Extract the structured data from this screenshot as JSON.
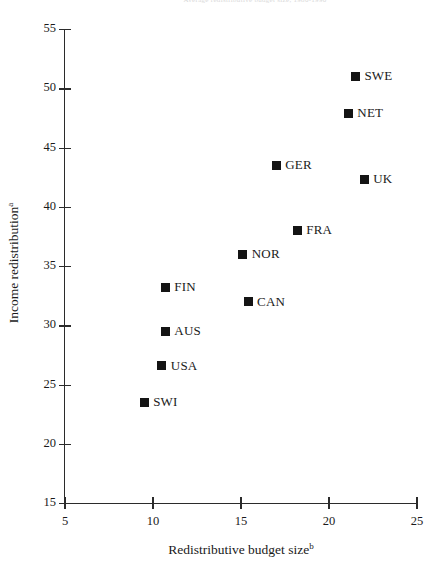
{
  "figure": {
    "top_cropped_text": "Average redistributive budget size, 1980-1990",
    "marker_color": "#141414",
    "axis_color": "#2b2b2b",
    "background": "#ffffff"
  },
  "chart_data": {
    "type": "scatter",
    "title": "",
    "xlabel": "Redistributive budget size",
    "xlabel_superscript": "b",
    "ylabel": "Income redistribution",
    "ylabel_superscript": "a",
    "xlim": [
      5,
      25
    ],
    "ylim": [
      15,
      55
    ],
    "xticks": [
      5,
      10,
      15,
      20,
      25
    ],
    "yticks": [
      15,
      20,
      25,
      30,
      35,
      40,
      45,
      50,
      55
    ],
    "xticklabels": [
      "5",
      "10",
      "15",
      "20",
      "25"
    ],
    "yticklabels": [
      "15",
      "20",
      "25",
      "30",
      "35",
      "40",
      "45",
      "50",
      "55"
    ],
    "grid": false,
    "legend": "none",
    "marker": "square",
    "points": [
      {
        "label": "SWE",
        "x": 21.5,
        "y": 51.0
      },
      {
        "label": "NET",
        "x": 21.1,
        "y": 47.9
      },
      {
        "label": "GER",
        "x": 17.0,
        "y": 43.5
      },
      {
        "label": "UK",
        "x": 22.0,
        "y": 42.3
      },
      {
        "label": "FRA",
        "x": 18.2,
        "y": 38.0
      },
      {
        "label": "NOR",
        "x": 15.1,
        "y": 36.0
      },
      {
        "label": "FIN",
        "x": 10.7,
        "y": 33.2
      },
      {
        "label": "CAN",
        "x": 15.4,
        "y": 32.0
      },
      {
        "label": "AUS",
        "x": 10.7,
        "y": 29.5
      },
      {
        "label": "USA",
        "x": 10.5,
        "y": 26.6
      },
      {
        "label": "SWI",
        "x": 9.5,
        "y": 23.5
      }
    ]
  }
}
